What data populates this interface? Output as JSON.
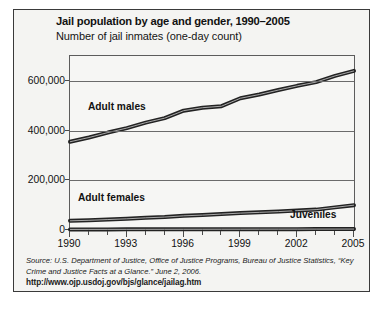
{
  "chart_data": {
    "type": "line",
    "title": "Jail population by age and gender, 1990–2005",
    "subtitle": "Number of jail inmates (one-day count)",
    "xlabel": "",
    "ylabel": "",
    "x": [
      1990,
      1991,
      1992,
      1993,
      1994,
      1995,
      1996,
      1997,
      1998,
      1999,
      2000,
      2001,
      2002,
      2003,
      2004,
      2005
    ],
    "xlim": [
      1990,
      2005
    ],
    "ylim": [
      0,
      700000
    ],
    "xticks": [
      1990,
      1993,
      1996,
      1999,
      2002,
      2005
    ],
    "xtick_labels": [
      "1990",
      "1993",
      "1996",
      "1999",
      "2002",
      "2005"
    ],
    "yticks": [
      0,
      200000,
      400000,
      600000
    ],
    "ytick_labels": [
      "0",
      "200,000",
      "400,000",
      "600,000"
    ],
    "minor_xticks_every": 1,
    "grid": "horizontal",
    "legend": "inline-labels",
    "line_color": "#222222",
    "series": [
      {
        "name": "Adult males",
        "label": "Adult males",
        "label_position": "above-line-left",
        "values": [
          355000,
          372000,
          392000,
          410000,
          432000,
          450000,
          480000,
          492000,
          498000,
          530000,
          545000,
          563000,
          580000,
          595000,
          620000,
          640000
        ]
      },
      {
        "name": "Adult females",
        "label": "Adult females",
        "label_position": "above-line-left",
        "values": [
          37000,
          39000,
          42000,
          45000,
          49000,
          52000,
          57000,
          60000,
          64000,
          68000,
          71000,
          74000,
          78000,
          82000,
          91000,
          100000
        ]
      },
      {
        "name": "Juveniles",
        "label": "Juveniles",
        "label_position": "below-line-right",
        "values": [
          2300,
          2400,
          2500,
          2600,
          2700,
          2800,
          2900,
          3000,
          3100,
          3200,
          3300,
          3400,
          3500,
          3600,
          3700,
          3800
        ]
      }
    ]
  },
  "source": {
    "citation": "Source: U.S. Department of Justice, Office of Justice Programs, Bureau of Justice Statistics, “Key Crime and Justice Facts at a Glance.” June 2, 2006.",
    "url": "http://www.ojp.usdoj.gov/bjs/glance/jailag.htm"
  }
}
